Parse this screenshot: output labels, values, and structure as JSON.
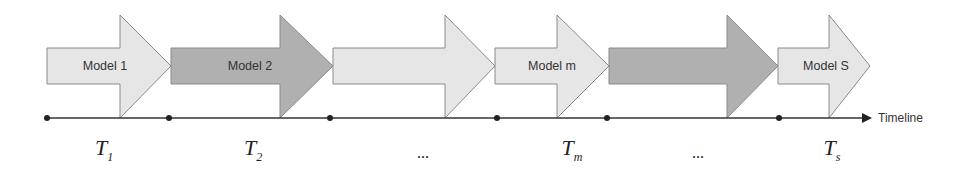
{
  "diagram": {
    "colors": {
      "light": "#e6e6e6",
      "dark": "#b0b0b0",
      "stroke": "#8a8a8a",
      "line": "#333333"
    },
    "arrows": [
      {
        "label": "Model 1",
        "shade": "light"
      },
      {
        "label": "Model 2",
        "shade": "dark"
      },
      {
        "label": "",
        "shade": "light"
      },
      {
        "label": "Model m",
        "shade": "light"
      },
      {
        "label": "",
        "shade": "dark"
      },
      {
        "label": "Model S",
        "shade": "light"
      }
    ],
    "timeline_label": "Timeline",
    "periods": [
      {
        "base": "T",
        "sub": "1"
      },
      {
        "base": "T",
        "sub": "2"
      },
      {
        "base": "...",
        "sub": ""
      },
      {
        "base": "T",
        "sub": "m"
      },
      {
        "base": "...",
        "sub": ""
      },
      {
        "base": "T",
        "sub": "s"
      }
    ]
  }
}
